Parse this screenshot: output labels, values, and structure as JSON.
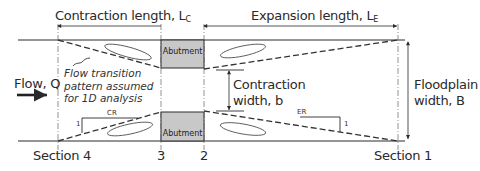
{
  "diagram": {
    "title_left": "Contraction length, L",
    "title_left_sub": "C",
    "title_right": "Expansion length, L",
    "title_right_sub": "E",
    "flow_label": "Flow, Q",
    "transition_note": [
      "Flow transition",
      "pattern assumed",
      "for 1D analysis"
    ],
    "abutment_top": "Abutment",
    "abutment_bottom": "Abutment",
    "contraction_width": [
      "Contraction",
      "width, b"
    ],
    "floodplain_width": [
      "Floodplain",
      "width, B"
    ],
    "cr_label": "CR",
    "er_label": "ER",
    "slope_one_left": "1",
    "slope_one_right": "1",
    "sections": {
      "s4": "Section 4",
      "s3": "3",
      "s2": "2",
      "s1": "Section 1"
    },
    "colors": {
      "line": "#2a2a2a",
      "abutment_fill": "#c8c8c8",
      "dash": "#333333"
    }
  }
}
